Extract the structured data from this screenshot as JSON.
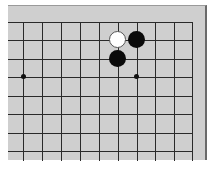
{
  "board": {
    "colors": {
      "board": "#cfcfcf",
      "line": "#2a2a2a",
      "black": "#0a0a0a",
      "white": "#ffffff"
    },
    "grid": {
      "x_lines": [
        23,
        42,
        61,
        80,
        99,
        118,
        137,
        155,
        174,
        192
      ],
      "y_lines": [
        21,
        39,
        58,
        76,
        95,
        113,
        132,
        150
      ]
    },
    "star_points": [
      {
        "x": 23,
        "y": 76
      },
      {
        "x": 136,
        "y": 76
      }
    ],
    "stones": [
      {
        "color": "white",
        "x": 117,
        "y": 39
      },
      {
        "color": "black",
        "x": 136,
        "y": 39
      },
      {
        "color": "black",
        "x": 117,
        "y": 58
      }
    ]
  }
}
